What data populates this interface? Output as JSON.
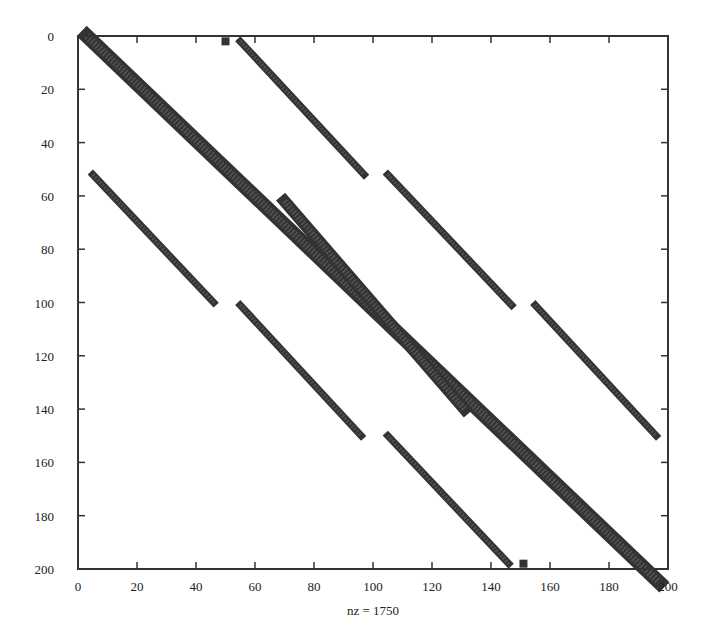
{
  "chart_data": {
    "type": "scatter",
    "title": "",
    "subtitle": "Sparsity pattern (spy plot)",
    "xlabel": "nz = 1750",
    "ylabel": "",
    "nz": 1750,
    "xlim": [
      0,
      200
    ],
    "ylim": [
      0,
      200
    ],
    "y_inverted": true,
    "grid": false,
    "legend": null,
    "x_ticks": [
      "0",
      "20",
      "40",
      "60",
      "80",
      "100",
      "120",
      "140",
      "160",
      "180",
      "200"
    ],
    "y_ticks": [
      "0",
      "20",
      "40",
      "60",
      "80",
      "100",
      "120",
      "140",
      "160",
      "180",
      "200"
    ],
    "marker_color": "#333333",
    "bands": [
      {
        "name": "main-diagonal",
        "start": {
          "col": 3,
          "row": 0
        },
        "end": {
          "col": 197,
          "row": 205
        },
        "width": 6
      },
      {
        "name": "inner-offdiagonal",
        "start": {
          "col": 70,
          "row": 62
        },
        "end": {
          "col": 131,
          "row": 140
        },
        "width": 5
      },
      {
        "name": "upper-band-1",
        "start": {
          "col": 55,
          "row": 2
        },
        "end": {
          "col": 97,
          "row": 52
        },
        "width": 3
      },
      {
        "name": "upper-band-2",
        "start": {
          "col": 105,
          "row": 52
        },
        "end": {
          "col": 147,
          "row": 101
        },
        "width": 3
      },
      {
        "name": "upper-band-3",
        "start": {
          "col": 155,
          "row": 101
        },
        "end": {
          "col": 196,
          "row": 150
        },
        "width": 3
      },
      {
        "name": "lower-band-1",
        "start": {
          "col": 5,
          "row": 52
        },
        "end": {
          "col": 46,
          "row": 100
        },
        "width": 3
      },
      {
        "name": "lower-band-2",
        "start": {
          "col": 55,
          "row": 101
        },
        "end": {
          "col": 96,
          "row": 150
        },
        "width": 3
      },
      {
        "name": "lower-band-3",
        "start": {
          "col": 105,
          "row": 150
        },
        "end": {
          "col": 146,
          "row": 198
        },
        "width": 3
      }
    ],
    "isolated_points": [
      {
        "col": 50,
        "row": 2
      },
      {
        "col": 151,
        "row": 198
      }
    ]
  },
  "labels": {
    "xlabel": "nz = 1750"
  }
}
